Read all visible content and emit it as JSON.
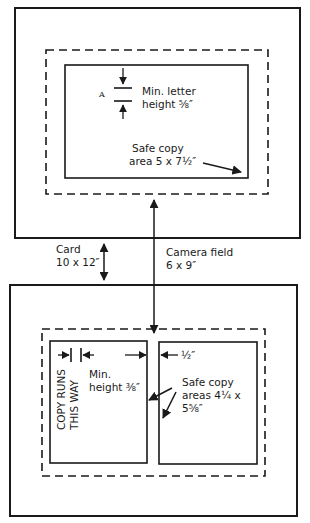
{
  "diagram": {
    "top_card": {
      "letter_marker": "A",
      "min_letter_label": [
        "Min. letter",
        "height ⅝″"
      ],
      "safe_copy_label": [
        "Safe copy",
        "area 5 x 7½″"
      ]
    },
    "middle": {
      "card_label": [
        "Card",
        "10 x 12″"
      ],
      "camera_field_label": [
        "Camera field",
        "6 x 9″"
      ]
    },
    "bottom_card": {
      "copy_direction_label": [
        "COPY RUNS",
        "THIS WAY"
      ],
      "min_height_label": [
        "Min.",
        "height ⅜″"
      ],
      "gap_label": "½″",
      "safe_copy_label": [
        "Safe copy",
        "areas 4¼ x",
        "5⅝″"
      ]
    },
    "colors": {
      "ink": "#1a1a1a",
      "background": "#ffffff"
    }
  }
}
